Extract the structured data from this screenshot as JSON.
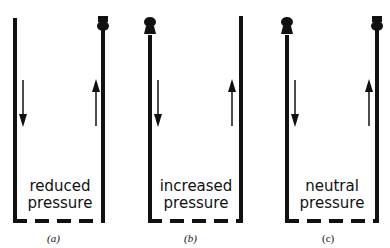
{
  "figure": {
    "panels": [
      {
        "id": "a",
        "label": "(a)",
        "caption_line1": "reduced",
        "caption_line2": "pressure",
        "left_cowl": false,
        "right_cowl": true
      },
      {
        "id": "b",
        "label": "(b)",
        "caption_line1": "increased",
        "caption_line2": "pressure",
        "left_cowl": true,
        "right_cowl": false
      },
      {
        "id": "c",
        "label": "(c)",
        "caption_line1": "neutral",
        "caption_line2": "pressure",
        "left_cowl": true,
        "right_cowl": true
      }
    ],
    "arrows": {
      "left": "down",
      "right": "up"
    },
    "colors": {
      "line": "#111111",
      "background": "#ffffff"
    }
  }
}
